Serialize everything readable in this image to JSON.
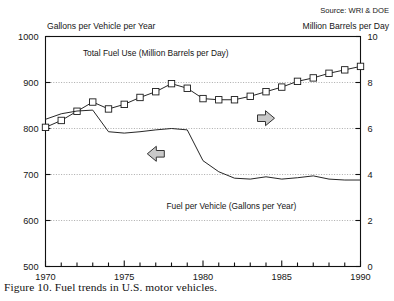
{
  "figure": {
    "caption": "Figure 10.   Fuel trends in U.S. motor vehicles.",
    "source": "Source: WRI & DOE",
    "left_axis_title": "Gallons per Vehicle per Year",
    "right_axis_title": "Million Barrels per Day"
  },
  "annotations": {
    "arrow_right_icon": "arrow-right-icon",
    "arrow_left_icon": "arrow-left-icon"
  },
  "chart_data": {
    "type": "line",
    "title": "",
    "xlabel": "",
    "ylabel": "Gallons per Vehicle per Year",
    "y2label": "Million Barrels per Day",
    "xlim": [
      1970,
      1990
    ],
    "ylim": [
      500,
      1000
    ],
    "y2lim": [
      0,
      10
    ],
    "xticks": [
      1970,
      1971,
      1972,
      1973,
      1974,
      1975,
      1976,
      1977,
      1978,
      1979,
      1980,
      1981,
      1982,
      1983,
      1984,
      1985,
      1986,
      1987,
      1988,
      1989,
      1990
    ],
    "xticklabels": [
      "1970",
      "",
      "",
      "",
      "",
      "1975",
      "",
      "",
      "",
      "",
      "1980",
      "",
      "",
      "",
      "",
      "1985",
      "",
      "",
      "",
      "",
      "1990"
    ],
    "yticks": [
      500,
      600,
      700,
      800,
      900,
      1000
    ],
    "yticklabels": [
      "500",
      "600",
      "700",
      "800",
      "900",
      "1000"
    ],
    "y2ticks": [
      0,
      2,
      4,
      6,
      8,
      10
    ],
    "y2ticklabels": [
      "0",
      "2",
      "4",
      "6",
      "8",
      "10"
    ],
    "grid": true,
    "gridlines_y": [
      600,
      700,
      800,
      900
    ],
    "legend": "inline-labels",
    "x": [
      1970,
      1971,
      1972,
      1973,
      1974,
      1975,
      1976,
      1977,
      1978,
      1979,
      1980,
      1981,
      1982,
      1983,
      1984,
      1985,
      1986,
      1987,
      1988,
      1989,
      1990
    ],
    "series": [
      {
        "name": "Total Fuel Use (Million Barrels per Day)",
        "axis": "right",
        "marker": "square",
        "label_x": 1977.0,
        "label_y2": 9.15,
        "values": [
          6.05,
          6.35,
          6.75,
          7.15,
          6.85,
          7.05,
          7.35,
          7.6,
          7.95,
          7.75,
          7.3,
          7.25,
          7.25,
          7.4,
          7.6,
          7.8,
          8.05,
          8.2,
          8.4,
          8.55,
          8.7
        ]
      },
      {
        "name": "Fuel per Vehicle (Gallons per Year)",
        "axis": "left",
        "marker": "none",
        "label_x": 1981.8,
        "label_y": 625,
        "values": [
          820,
          832,
          838,
          840,
          793,
          790,
          793,
          797,
          800,
          797,
          730,
          706,
          692,
          690,
          695,
          690,
          693,
          697,
          690,
          688,
          688
        ]
      }
    ],
    "annotations": [
      {
        "name": "arrow-right-icon",
        "points_to": "right-axis",
        "x": 1984.0,
        "y2": 6.45
      },
      {
        "name": "arrow-left-icon",
        "points_to": "left-axis",
        "x": 1977.0,
        "y": 745
      }
    ]
  }
}
